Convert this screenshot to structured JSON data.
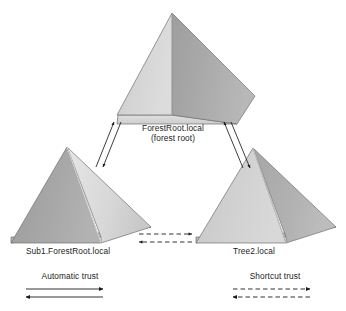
{
  "diagram": {
    "background_color": "#ffffff",
    "nodes": [
      {
        "id": "forest-root",
        "label_line1": "ForestRoot.local",
        "label_line2": "(forest root)",
        "position": "top-center",
        "left_face_color": "#d2d2d2",
        "right_face_color": "#a9a9a9",
        "base_face_color": "#d9d9d9"
      },
      {
        "id": "sub1",
        "label_line1": "Sub1.ForestRoot.local",
        "label_line2": "",
        "position": "bottom-left",
        "left_face_color": "#a5a5a5",
        "right_face_color": "#dcdcdc",
        "base_face_color": "#b4b4b4"
      },
      {
        "id": "tree2",
        "label_line1": "Tree2.local",
        "label_line2": "",
        "position": "bottom-right",
        "left_face_color": "#cfcfcf",
        "right_face_color": "#aeaeae",
        "base_face_color": "#bdbdbd"
      }
    ],
    "connections": [
      {
        "id": "forestroot-sub1",
        "from": "forest-root",
        "to": "sub1",
        "style": "solid",
        "direction": "bidirectional",
        "trust_type": "Automatic trust"
      },
      {
        "id": "forestroot-tree2",
        "from": "forest-root",
        "to": "tree2",
        "style": "solid",
        "direction": "bidirectional",
        "trust_type": "Automatic trust"
      },
      {
        "id": "sub1-tree2",
        "from": "sub1",
        "to": "tree2",
        "style": "dashed",
        "direction": "bidirectional",
        "trust_type": "Shortcut trust"
      }
    ],
    "legend": [
      {
        "id": "automatic-trust",
        "label": "Automatic trust",
        "style": "solid",
        "direction": "bidirectional",
        "line_color": "#1b1b1b"
      },
      {
        "id": "shortcut-trust",
        "label": "Shortcut trust",
        "style": "dashed",
        "direction": "bidirectional",
        "line_color": "#1b1b1b"
      }
    ],
    "line_color": "#1b1b1b",
    "edge_stroke_color": "#6e6e6e"
  }
}
